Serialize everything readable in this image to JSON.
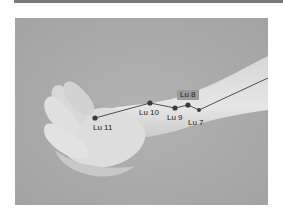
{
  "figure": {
    "points": [
      {
        "id": "lu11",
        "label": "Lu 11"
      },
      {
        "id": "lu10",
        "label": "Lu 10"
      },
      {
        "id": "lu9",
        "label": "Lu 9"
      },
      {
        "id": "lu8",
        "label": "Lu 8"
      },
      {
        "id": "lu7",
        "label": "Lu 7"
      }
    ],
    "colors": {
      "background": "#a9a9a9",
      "skin": "#dcdcdc",
      "line": "#2a2a2a",
      "point": "#3a3a3a",
      "label_box": "#9b9b9b"
    }
  }
}
